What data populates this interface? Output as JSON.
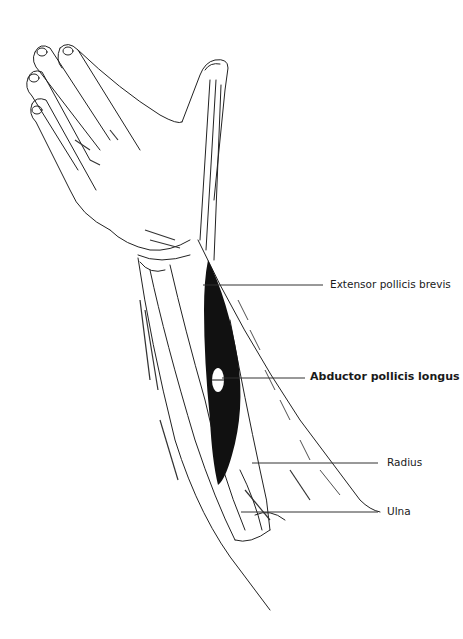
{
  "figure": {
    "highlighted_structure": "Abductor pollicis longus"
  },
  "labels": [
    {
      "id": "extensor",
      "text": "Extensor pollicis brevis",
      "bold": false,
      "x": 330,
      "y": 278,
      "line": [
        203,
        285,
        323,
        285
      ]
    },
    {
      "id": "abductor",
      "text": "Abductor pollicis longus",
      "bold": true,
      "x": 310,
      "y": 370,
      "line": [
        222,
        378,
        305,
        378
      ]
    },
    {
      "id": "radius",
      "text": "Radius",
      "bold": false,
      "x": 387,
      "y": 456,
      "line": [
        252,
        463,
        378,
        463
      ]
    },
    {
      "id": "ulna",
      "text": "Ulna",
      "bold": false,
      "x": 387,
      "y": 505,
      "line": [
        241,
        512,
        378,
        512
      ]
    }
  ],
  "colors": {
    "ink": "#1a1a1a",
    "muscle": "#111111",
    "background": "#ffffff"
  }
}
